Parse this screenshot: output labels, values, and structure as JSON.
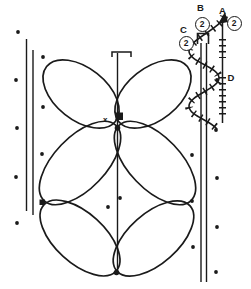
{
  "figure": {
    "background_color": "#ffffff",
    "ink_color": "#1a1a1a",
    "labels": {
      "a": "A",
      "b": "B",
      "c": "C",
      "d": "D",
      "x_marker": "x"
    },
    "badges": {
      "a_value": "2",
      "b_value": "2",
      "c_value": "2"
    },
    "dots": [
      [
        18,
        32
      ],
      [
        43,
        57
      ],
      [
        16,
        80
      ],
      [
        43,
        107
      ],
      [
        17,
        128
      ],
      [
        42,
        154
      ],
      [
        16,
        177
      ],
      [
        17,
        223
      ],
      [
        120,
        198
      ],
      [
        108,
        207
      ],
      [
        192,
        155
      ],
      [
        217,
        178
      ],
      [
        192,
        201
      ],
      [
        217,
        227
      ],
      [
        193,
        247
      ],
      [
        216,
        272
      ],
      [
        217,
        80
      ],
      [
        216,
        130
      ]
    ]
  }
}
